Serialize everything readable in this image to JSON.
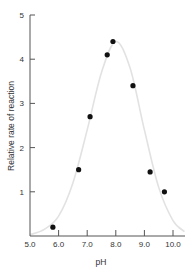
{
  "chart_data": {
    "type": "scatter",
    "title": "",
    "xlabel": "pH",
    "ylabel": "Relative rate of reaction",
    "xlim": [
      5.0,
      10.4
    ],
    "ylim": [
      0,
      5
    ],
    "x_ticks": [
      "5.0",
      "6.0",
      "7.0",
      "8.0",
      "9.0",
      "10.0"
    ],
    "y_ticks": [
      "1",
      "2",
      "3",
      "4",
      "5"
    ],
    "grid": false,
    "legend": null,
    "series": [
      {
        "name": "measured",
        "x": [
          5.8,
          6.7,
          7.1,
          7.7,
          7.9,
          8.6,
          9.2,
          9.7
        ],
        "y": [
          0.2,
          1.5,
          2.7,
          4.1,
          4.4,
          3.4,
          1.45,
          1.0
        ]
      },
      {
        "name": "fitted curve",
        "type": "line",
        "x": [
          5.0,
          5.5,
          6.0,
          6.5,
          7.0,
          7.5,
          8.0,
          8.5,
          9.0,
          9.5,
          10.0,
          10.4
        ],
        "y": [
          0.03,
          0.15,
          0.45,
          1.2,
          2.4,
          3.7,
          4.4,
          3.8,
          2.4,
          1.1,
          0.35,
          0.1
        ]
      }
    ]
  }
}
